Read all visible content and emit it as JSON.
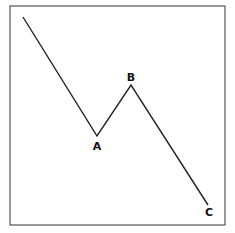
{
  "diagram": {
    "type": "abc-correction-wave",
    "frame": {
      "x": 10,
      "y": 6,
      "width": 215,
      "height": 219
    },
    "path_points": [
      {
        "id": "start",
        "x": 23,
        "y": 17,
        "label": ""
      },
      {
        "id": "A",
        "x": 97,
        "y": 136,
        "label": "A"
      },
      {
        "id": "B",
        "x": 131,
        "y": 85,
        "label": "B"
      },
      {
        "id": "C",
        "x": 208,
        "y": 205,
        "label": "C"
      }
    ],
    "labels": {
      "A": {
        "text": "A",
        "x": 97,
        "y": 150
      },
      "B": {
        "text": "B",
        "x": 131,
        "y": 81
      },
      "C": {
        "text": "C",
        "x": 209,
        "y": 216
      }
    },
    "colors": {
      "line": "#222222",
      "frame": "#555555",
      "background": "#ffffff"
    }
  }
}
